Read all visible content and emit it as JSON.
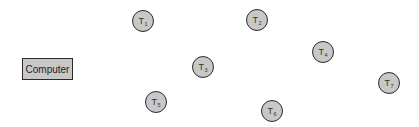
{
  "diagram": {
    "type": "network-topology",
    "computer": {
      "label": "Computer",
      "x": 22,
      "y": 58,
      "w": 51,
      "h": 22
    },
    "terminals": [
      {
        "id": "T1",
        "prefix": "T",
        "sub": "1",
        "cx": 143,
        "cy": 21
      },
      {
        "id": "T2",
        "prefix": "T",
        "sub": "2",
        "cx": 257,
        "cy": 20
      },
      {
        "id": "T3",
        "prefix": "T",
        "sub": "3",
        "cx": 203,
        "cy": 67
      },
      {
        "id": "T4",
        "prefix": "T",
        "sub": "4",
        "cx": 323,
        "cy": 52
      },
      {
        "id": "T5",
        "prefix": "T",
        "sub": "5",
        "cx": 156,
        "cy": 102
      },
      {
        "id": "T6",
        "prefix": "T",
        "sub": "6",
        "cx": 272,
        "cy": 111
      },
      {
        "id": "T7",
        "prefix": "T",
        "sub": "7",
        "cx": 389,
        "cy": 83
      }
    ],
    "colors": {
      "node_fill": "#c8c8c8",
      "node_border": "#2a2a2a",
      "background": "#ffffff"
    }
  }
}
